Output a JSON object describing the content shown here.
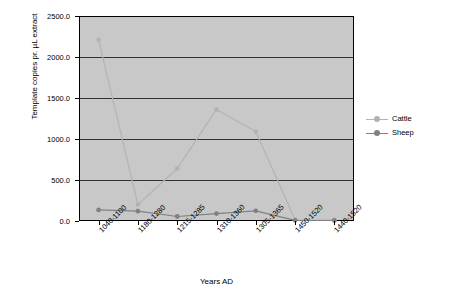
{
  "chart_data": {
    "type": "line",
    "title": "",
    "xlabel": "Years AD",
    "ylabel": "Template copies pr. µL extract",
    "categories": [
      "1040-1100",
      "1180-1280",
      "1215-1285",
      "1310-1360",
      "1305-1365",
      "1450-1520",
      "1440-1520"
    ],
    "yticks": [
      "0.0",
      "500.0",
      "1000.0",
      "1500.0",
      "2000.0",
      "2500.0"
    ],
    "ylim": [
      0,
      2500
    ],
    "grid": true,
    "legend_position": "right",
    "series": [
      {
        "name": "Cattle",
        "color": "#b3b3b3",
        "values": [
          2210,
          200,
          640,
          1360,
          1090,
          15,
          10
        ]
      },
      {
        "name": "Sheep",
        "color": "#808080",
        "values": [
          135,
          120,
          55,
          90,
          125,
          8,
          6
        ]
      }
    ]
  }
}
